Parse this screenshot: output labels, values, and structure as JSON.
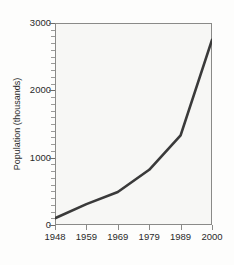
{
  "chart_data": {
    "type": "line",
    "title": "",
    "xlabel": "",
    "ylabel": "Population (thousands)",
    "x": [
      1948,
      1959,
      1969,
      1979,
      1989,
      2000
    ],
    "categories": [
      "1948",
      "1959",
      "1969",
      "1979",
      "1989",
      "2000"
    ],
    "values": [
      100,
      310,
      490,
      820,
      1330,
      2750
    ],
    "series": [
      {
        "name": "Population",
        "values": [
          100,
          310,
          490,
          820,
          1330,
          2750
        ]
      }
    ],
    "xlim": [
      1948,
      2000
    ],
    "ylim": [
      0,
      3000
    ],
    "y_ticks": [
      0,
      1000,
      2000,
      3000
    ],
    "y_tick_labels": [
      "0",
      "1000",
      "2000",
      "3000"
    ],
    "y_minor_tick_step": 100,
    "x_ticks": [
      1948,
      1959,
      1969,
      1979,
      1989,
      2000
    ],
    "x_tick_labels": [
      "1948",
      "1959",
      "1969",
      "1979",
      "1989",
      "2000"
    ],
    "grid": false,
    "legend": false,
    "legend_position": "none",
    "line_color": "#3a3a3a",
    "background_color": "#f7f7f5",
    "axis_color": "#8a8a88"
  }
}
